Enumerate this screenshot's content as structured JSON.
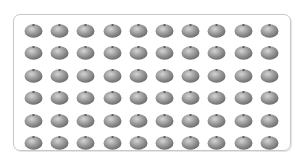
{
  "figure": {
    "rows": 6,
    "columns": 10,
    "total_items": 60,
    "item_icon": "tomato-icon",
    "item_color": "#8f8f8f",
    "frame_color": "#c8c8c8"
  }
}
